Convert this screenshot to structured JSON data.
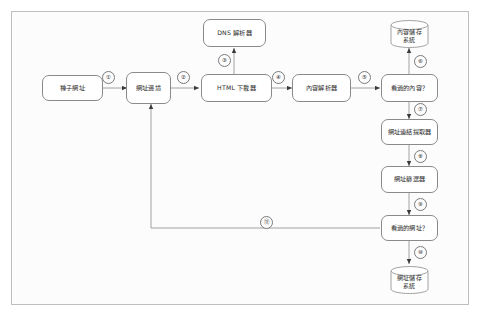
{
  "diagram": {
    "canvas": {
      "background": "#fcfcfc",
      "border_color": "#bfbfbf"
    },
    "nodes": [
      {
        "id": "seed-urls",
        "label": "種子網址",
        "shape": "rounded-rect"
      },
      {
        "id": "url-frontier",
        "label": "網址邊境",
        "shape": "rounded-rect"
      },
      {
        "id": "dns-resolver",
        "label": "DNS 解析器",
        "shape": "rounded-rect"
      },
      {
        "id": "html-downloader",
        "label": "HTML 下載器",
        "shape": "rounded-rect"
      },
      {
        "id": "content-parser",
        "label": "內容解析器",
        "shape": "rounded-rect"
      },
      {
        "id": "seen-content",
        "label": "看過的內容？",
        "shape": "rounded-rect"
      },
      {
        "id": "link-extractor",
        "label": "網址連結提取器",
        "shape": "rounded-rect"
      },
      {
        "id": "url-filter",
        "label": "網址篩選器",
        "shape": "rounded-rect"
      },
      {
        "id": "seen-url",
        "label": "看過的網址？",
        "shape": "rounded-rect"
      }
    ],
    "datastores": [
      {
        "id": "content-storage",
        "line1": "內容儲存",
        "line2": "系統",
        "shape": "cylinder"
      },
      {
        "id": "url-storage",
        "line1": "網址儲存",
        "line2": "系統",
        "shape": "cylinder"
      }
    ],
    "edges": [
      {
        "n": "1",
        "label": "①",
        "from": "seed-urls",
        "to": "url-frontier"
      },
      {
        "n": "2",
        "label": "②",
        "from": "url-frontier",
        "to": "html-downloader"
      },
      {
        "n": "3",
        "label": "③",
        "from": "html-downloader",
        "to": "dns-resolver"
      },
      {
        "n": "4",
        "label": "④",
        "from": "html-downloader",
        "to": "content-parser"
      },
      {
        "n": "5",
        "label": "⑤",
        "from": "content-parser",
        "to": "seen-content"
      },
      {
        "n": "6",
        "label": "⑥",
        "from": "seen-content",
        "to": "content-storage"
      },
      {
        "n": "7",
        "label": "⑦",
        "from": "seen-content",
        "to": "link-extractor"
      },
      {
        "n": "8",
        "label": "⑧",
        "from": "link-extractor",
        "to": "url-filter"
      },
      {
        "n": "9",
        "label": "⑨",
        "from": "url-filter",
        "to": "seen-url"
      },
      {
        "n": "10",
        "label": "⑩",
        "from": "seen-url",
        "to": "url-storage"
      },
      {
        "n": "11",
        "label": "⑪",
        "from": "seen-url",
        "to": "url-frontier"
      }
    ]
  }
}
